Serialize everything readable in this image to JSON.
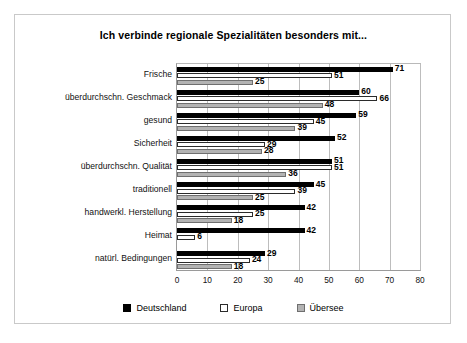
{
  "chart_data": {
    "type": "bar",
    "orientation": "horizontal",
    "title": "Ich verbinde regionale Spezialitäten besonders mit...",
    "xlabel": "",
    "ylabel": "",
    "xlim": [
      0,
      80
    ],
    "xticks": [
      0,
      10,
      20,
      30,
      40,
      50,
      60,
      70,
      80
    ],
    "grid": true,
    "legend_position": "bottom",
    "categories": [
      "Frische",
      "überdurchschn. Geschmack",
      "gesund",
      "Sicherheit",
      "überdurchschn. Qualität",
      "traditionell",
      "handwerkl. Herstellung",
      "Heimat",
      "natürl. Bedingungen"
    ],
    "series": [
      {
        "name": "Deutschland",
        "color": "#000000",
        "values": [
          71,
          60,
          59,
          52,
          51,
          45,
          42,
          42,
          29
        ]
      },
      {
        "name": "Europa",
        "color": "#ffffff",
        "values": [
          51,
          66,
          45,
          29,
          51,
          39,
          25,
          6,
          24
        ]
      },
      {
        "name": "Übersee",
        "color": "#b3b3b3",
        "values": [
          25,
          48,
          39,
          28,
          36,
          25,
          18,
          null,
          18
        ]
      }
    ]
  },
  "legend": {
    "items": [
      {
        "label": "Deutschland"
      },
      {
        "label": "Europa"
      },
      {
        "label": "Übersee"
      }
    ]
  }
}
